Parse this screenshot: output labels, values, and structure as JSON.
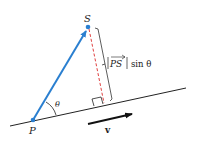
{
  "diagram": {
    "title": "",
    "points": {
      "P": {
        "label": "P",
        "x": 33,
        "y": 120
      },
      "S": {
        "label": "S",
        "x": 88,
        "y": 27
      }
    },
    "line": {
      "x1": 10,
      "y1": 126,
      "x2": 186,
      "y2": 88
    },
    "foot": {
      "x": 104,
      "y": 104
    },
    "angle_label": "θ",
    "distance_label": {
      "vector": "PS",
      "suffix": "sin θ"
    },
    "direction_vector_label": "v",
    "colors": {
      "vector_PS": "#2a7fd0",
      "perpendicular": "#e04040",
      "line": "#222222",
      "bracket": "#333333"
    }
  }
}
